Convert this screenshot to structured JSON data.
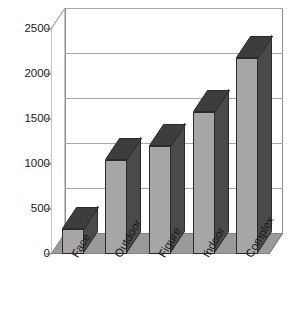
{
  "chart_data": {
    "type": "bar",
    "title": "",
    "subtitle": "",
    "xlabel": "",
    "ylabel": "",
    "categories": [
      "Face",
      "Outdoor",
      "Figure",
      "Indoor",
      "Complex"
    ],
    "values": [
      280,
      1050,
      1200,
      1580,
      2180
    ],
    "series": [
      {
        "name": "",
        "values": [
          280,
          1050,
          1200,
          1580,
          2180
        ]
      }
    ],
    "ylim": [
      0,
      2500
    ],
    "yticks": [
      0,
      500,
      1000,
      1500,
      2000,
      2500
    ],
    "ytick_labels": [
      "0",
      "500",
      "1000",
      "1500",
      "2000",
      "2500"
    ],
    "grid": true,
    "grid_axis": "y",
    "legend": false,
    "legend_position": "none",
    "style": "3d-column",
    "annotations": [],
    "colors": {
      "bar_front": "#a6a6a6",
      "bar_side": "#4a4a4a",
      "bar_top": "#3d3d3d",
      "bar_outline": "#2b2b2b",
      "floor": "#9a9a9a",
      "floor_edge": "#6e6e6e",
      "wall": "#ffffff",
      "gridline": "#a8a8a8",
      "axis": "#555555",
      "text": "#1a1a1a",
      "background": "#ffffff"
    }
  }
}
